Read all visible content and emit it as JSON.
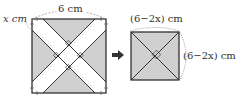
{
  "left_figure": {
    "width_label": "6 cm",
    "corner_label": "x cm",
    "shade_color": "#d0d0d0",
    "line_color": "#222222"
  },
  "arrow": {
    "icon": "right-arrow-icon"
  },
  "right_figure": {
    "top_label": "(6−2x) cm",
    "side_label": "(6−2x) cm",
    "shade_color": "#d0d0d0"
  }
}
